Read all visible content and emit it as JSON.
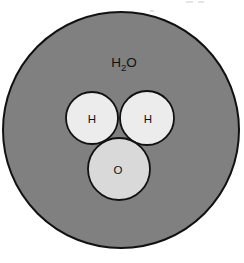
{
  "figure": {
    "formula_label": {
      "base": "H",
      "subscript": "2",
      "tail": "O"
    },
    "atoms": [
      {
        "id": "hydrogen-left",
        "label": "H",
        "cx": 92,
        "cy": 118,
        "r": 26,
        "fill": "#ececec",
        "stroke": "#111111"
      },
      {
        "id": "hydrogen-right",
        "label": "H",
        "cx": 147,
        "cy": 118,
        "r": 27,
        "fill": "#ececec",
        "stroke": "#111111"
      },
      {
        "id": "oxygen",
        "label": "O",
        "cx": 119,
        "cy": 169,
        "r": 31,
        "fill": "#d9d9d9",
        "stroke": "#111111"
      }
    ],
    "shell": {
      "id": "water-molecule-shell",
      "cx": 121,
      "cy": 130,
      "r": 118,
      "fill": "#808080",
      "stroke": "#111111"
    },
    "colors": {
      "shell_gray": "#808080",
      "hydrogen_gray": "#ececec",
      "oxygen_gray": "#d9d9d9",
      "outline_black": "#111111",
      "page_white": "#ffffff"
    }
  }
}
